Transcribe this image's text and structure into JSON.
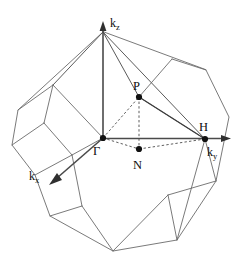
{
  "figure": {
    "type": "brillouin-zone-diagram",
    "shape": "truncated octahedron",
    "background_color": "#ffffff",
    "edge_color": "#6b6b6b",
    "symmetry_line_color": "#3c3c3c",
    "point_color": "#111111"
  },
  "axes": [
    {
      "id": "kz",
      "label": "k",
      "subscript": "z",
      "direction": "up",
      "origin": [
        103,
        138
      ],
      "tip": [
        103,
        26
      ],
      "label_pos": [
        111,
        24
      ]
    },
    {
      "id": "ky",
      "label": "k",
      "subscript": "y",
      "direction": "right",
      "origin": [
        103,
        138
      ],
      "tip": [
        226,
        138
      ],
      "label_pos": [
        209,
        154
      ]
    },
    {
      "id": "kx",
      "label": "k",
      "subscript": "x",
      "direction": "down-left",
      "origin": [
        103,
        138
      ],
      "tip": [
        52,
        182
      ],
      "label_pos": [
        32,
        180
      ]
    }
  ],
  "points": [
    {
      "id": "gamma",
      "label": "Γ",
      "x": 103,
      "y": 138,
      "label_x": 96,
      "label_y": 153
    },
    {
      "id": "P",
      "label": "P",
      "x": 139,
      "y": 97,
      "label_x": 133,
      "label_y": 90
    },
    {
      "id": "N",
      "label": "N",
      "x": 139,
      "y": 149,
      "label_x": 133,
      "label_y": 168
    },
    {
      "id": "H",
      "label": "H",
      "x": 205,
      "y": 139,
      "label_x": 200,
      "label_y": 131
    }
  ],
  "symmetry_paths": [
    {
      "id": "gamma-to-H",
      "style": "solid",
      "from": "gamma",
      "to": "H"
    },
    {
      "id": "P-to-H",
      "style": "solid",
      "from": "P",
      "to": "H"
    },
    {
      "id": "gamma-to-P",
      "style": "dashed",
      "from": "gamma",
      "to": "P"
    },
    {
      "id": "gamma-to-N",
      "style": "dashed",
      "from": "gamma",
      "to": "N"
    },
    {
      "id": "N-to-H",
      "style": "dashed",
      "from": "N",
      "to": "H"
    },
    {
      "id": "P-to-N",
      "style": "dashed",
      "from": "P",
      "to": "N"
    }
  ],
  "polyhedron": {
    "outline": "M 103,32 L 18,110 L 12,145 L 35,175 L 50,216 L 113,251 L 177,240 L 216,181 L 229,117 L 206,70 L 103,32 Z",
    "vertices_outer": [
      [
        103,
        32
      ],
      [
        18,
        110
      ],
      [
        12,
        145
      ],
      [
        35,
        175
      ],
      [
        50,
        216
      ],
      [
        113,
        251
      ],
      [
        177,
        240
      ],
      [
        216,
        181
      ],
      [
        229,
        117
      ],
      [
        206,
        70
      ]
    ],
    "inner_edges": [
      "M 103,32 L 103,138",
      "M 103,32 L 205,139",
      "M 103,32 L 53,85",
      "M 103,32 L 139,97",
      "M 103,138 L 53,85",
      "M 103,138 L 52,182",
      "M 205,139 L 139,97",
      "M 205,139 L 177,240",
      "M 205,139 L 216,181",
      "M 53,85 L 18,110",
      "M 53,85 L 44,123",
      "M 44,123 L 12,145",
      "M 44,123 L 72,155",
      "M 72,155 L 35,175",
      "M 72,155 L 82,206",
      "M 82,206 L 50,216",
      "M 82,206 L 113,251",
      "M 113,251 L 168,195",
      "M 168,195 L 177,240",
      "M 168,195 L 216,181",
      "M 139,97 L 206,70",
      "M 139,97 L 172,59"
    ]
  }
}
